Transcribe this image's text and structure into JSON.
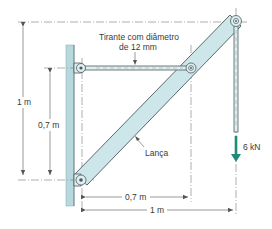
{
  "diagram": {
    "type": "structural-bracket",
    "colors": {
      "member_fill": "#cde6ea",
      "member_stroke": "#4d5a5e",
      "wall_fill": "#b7d8dd",
      "load_arrow": "#1f8a78",
      "dimension_line": "#555555",
      "text": "#3a3a3a"
    },
    "labels": {
      "tie_rod": "Tirante com diâmetro de 12 mm",
      "tie_rod_line1": "Tirante com diâmetro",
      "tie_rod_line2": "de 12 mm",
      "boom": "Lança",
      "load": "6 kN"
    },
    "dimensions": {
      "vertical_total": "1 m",
      "vertical_tie": "0,7 m",
      "horizontal_tie": "0,7 m",
      "horizontal_total": "1 m"
    },
    "components": [
      {
        "name": "wall",
        "description": "vertical support wall"
      },
      {
        "name": "tie-rod",
        "description": "horizontal rod from wall to boom, diameter 12 mm"
      },
      {
        "name": "boom",
        "description": "diagonal member (Lança) from lower wall pin to top pin"
      },
      {
        "name": "hanger",
        "description": "vertical rod from top pin carrying load"
      },
      {
        "name": "load",
        "description": "downward force 6 kN"
      }
    ]
  }
}
